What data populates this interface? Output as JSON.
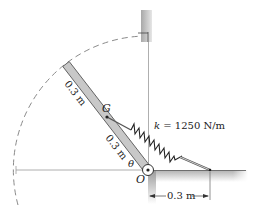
{
  "diagram": {
    "spring_label": "k = 1250 N/m",
    "spring_k_symbol": "k",
    "spring_k_rest": " = 1250 N/m",
    "bar_upper_length": "0.3 m",
    "bar_lower_length": "0.3 m",
    "center_of_mass_label": "G",
    "pivot_label": "O",
    "angle_label": "θ",
    "dimension_label": "0.3 m",
    "colors": {
      "bar_fill": "#c8c8c8",
      "bar_stroke": "#555555",
      "dashed_arc": "#888888",
      "wall_shade": "#b8b8b8",
      "line": "#777777",
      "spring": "#222222"
    }
  }
}
